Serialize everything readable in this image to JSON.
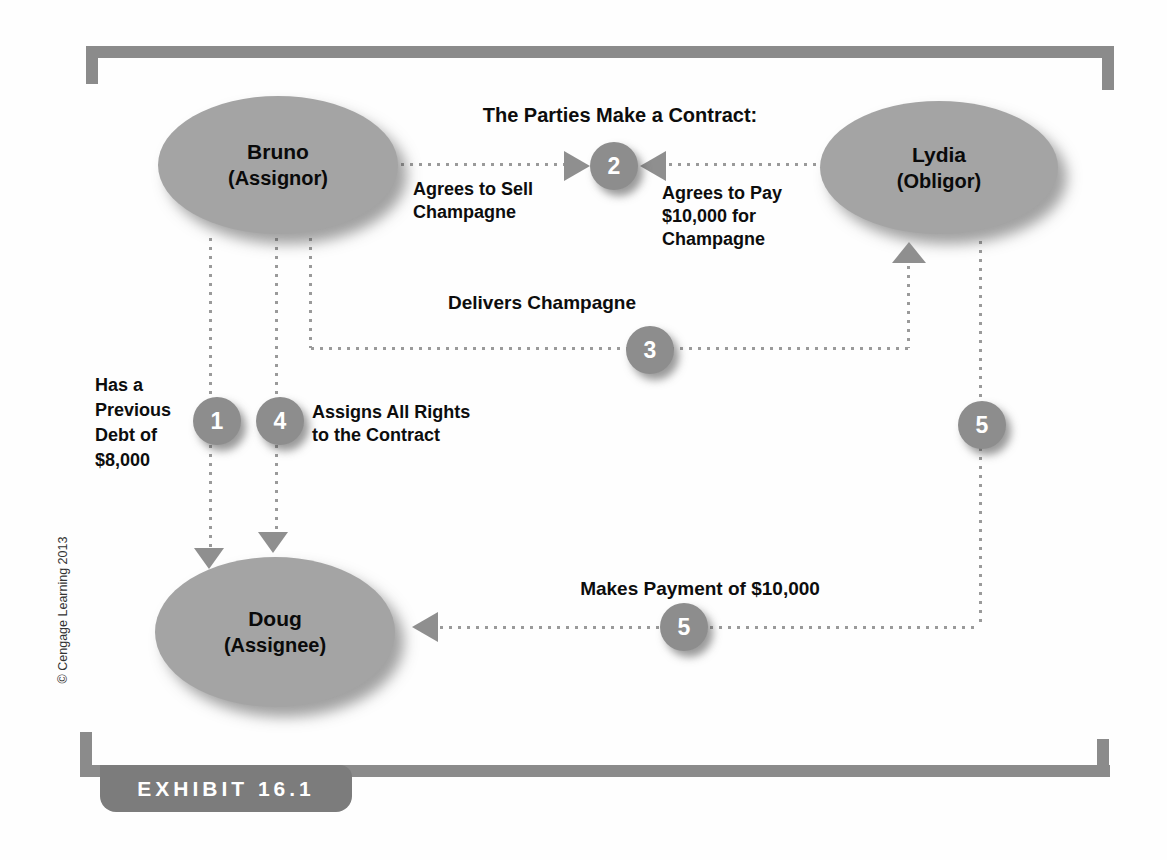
{
  "exhibit_label": "EXHIBIT 16.1",
  "copyright_note": "© Cengage Learning 2013",
  "heading": "The Parties Make a Contract:",
  "nodes": {
    "bruno": {
      "name": "Bruno",
      "role": "(Assignor)"
    },
    "lydia": {
      "name": "Lydia",
      "role": "(Obligor)"
    },
    "doug": {
      "name": "Doug",
      "role": "(Assignee)"
    }
  },
  "labels": {
    "agrees_sell": [
      "Agrees to Sell",
      "Champagne"
    ],
    "agrees_pay": [
      "Agrees to Pay",
      "$10,000 for",
      "Champagne"
    ],
    "delivers": "Delivers Champagne",
    "debt": [
      "Has a",
      "Previous",
      "Debt of",
      "$8,000"
    ],
    "assigns": [
      "Assigns All Rights",
      "to the Contract"
    ],
    "payment": "Makes Payment of $10,000"
  },
  "badges": {
    "step1": "1",
    "step2": "2",
    "step3": "3",
    "step4": "4",
    "step5_vertical": "5",
    "step5_horizontal": "5"
  },
  "colors": {
    "node_fill": "#a4a4a4",
    "badge_fill": "#8d8d8d",
    "frame": "#8b8b8b",
    "tab_fill": "#7c7c7c",
    "tab_text": "#ffffff",
    "dot": "#9a9a9a",
    "arrow": "#8f8f8f",
    "text": "#111111"
  }
}
